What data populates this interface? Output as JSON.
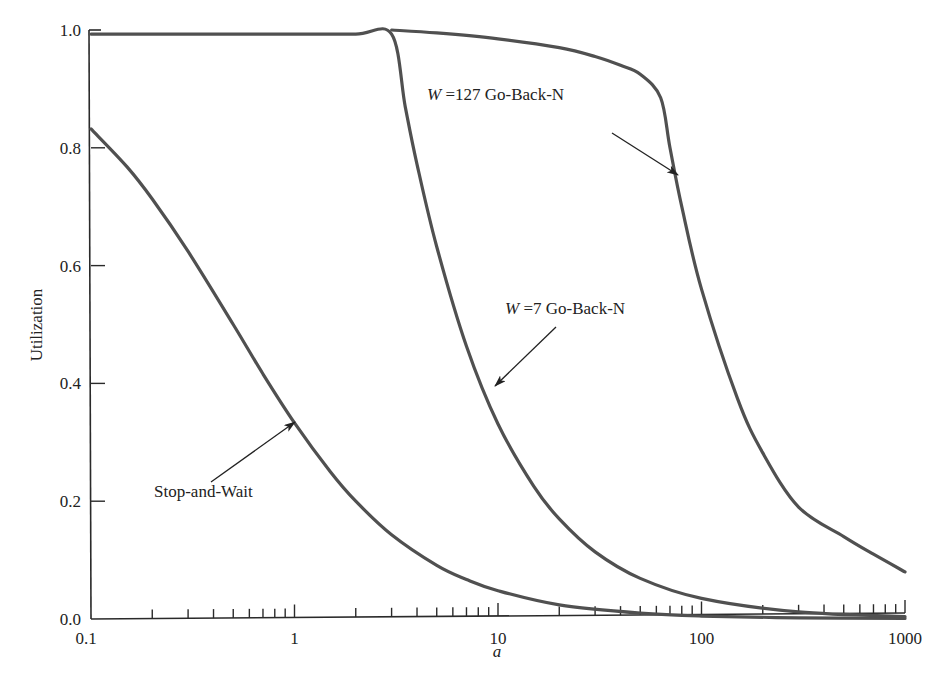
{
  "chart_data": {
    "type": "line",
    "title": "",
    "xlabel": "a",
    "ylabel": "Utilization",
    "xscale": "log",
    "xlim": [
      0.1,
      1000
    ],
    "ylim": [
      0.0,
      1.0
    ],
    "grid": false,
    "legend": "none (inline annotations with arrows)",
    "x_ticks": [
      {
        "value": 0.1,
        "label": "0.1"
      },
      {
        "value": 1,
        "label": "1"
      },
      {
        "value": 10,
        "label": "10"
      },
      {
        "value": 100,
        "label": "100"
      },
      {
        "value": 1000,
        "label": "1000"
      }
    ],
    "y_ticks": [
      {
        "value": 0.0,
        "label": "0.0"
      },
      {
        "value": 0.2,
        "label": "0.2"
      },
      {
        "value": 0.4,
        "label": "0.4"
      },
      {
        "value": 0.6,
        "label": "0.6"
      },
      {
        "value": 0.8,
        "label": "0.8"
      },
      {
        "value": 1.0,
        "label": "1.0"
      }
    ],
    "series": [
      {
        "name": "Stop-and-Wait",
        "x": [
          0.1,
          0.15,
          0.2,
          0.3,
          0.5,
          0.7,
          1,
          1.5,
          2,
          3,
          5,
          7,
          10,
          20,
          50,
          100,
          300,
          1000
        ],
        "values": [
          0.832,
          0.768,
          0.713,
          0.624,
          0.5,
          0.416,
          0.333,
          0.25,
          0.2,
          0.143,
          0.091,
          0.067,
          0.048,
          0.024,
          0.01,
          0.005,
          0.002,
          0.001
        ]
      },
      {
        "name": "W = 7 Go-Back-N",
        "x": [
          0.1,
          0.5,
          1,
          2,
          3,
          3.5,
          4,
          5,
          7,
          10,
          15,
          20,
          30,
          50,
          100,
          300,
          1000
        ],
        "values": [
          0.993,
          0.993,
          0.993,
          0.993,
          0.993,
          0.87,
          0.772,
          0.632,
          0.463,
          0.331,
          0.225,
          0.17,
          0.114,
          0.069,
          0.035,
          0.012,
          0.004
        ]
      },
      {
        "name": "W = 127 Go-Back-N",
        "x": [
          3,
          5,
          10,
          20,
          30,
          40,
          50,
          63,
          70,
          80,
          100,
          150,
          200,
          300,
          500,
          700,
          1000
        ],
        "values": [
          1.0,
          0.995,
          0.985,
          0.97,
          0.955,
          0.94,
          0.925,
          0.885,
          0.8,
          0.7,
          0.56,
          0.375,
          0.282,
          0.19,
          0.14,
          0.11,
          0.08
        ]
      }
    ],
    "annotations": [
      {
        "text_italic": "W",
        "text": " =127 Go-Back-N",
        "points_to_series": "W = 127 Go-Back-N",
        "label_pos": [
          427,
          100
        ],
        "arrow_from": [
          612,
          133
        ],
        "arrow_to": [
          678,
          175
        ]
      },
      {
        "text_italic": "W",
        "text": " =7 Go-Back-N",
        "points_to_series": "W = 7 Go-Back-N",
        "label_pos": [
          505,
          314
        ],
        "arrow_from": [
          556,
          327
        ],
        "arrow_to": [
          495,
          386
        ]
      },
      {
        "text": "Stop-and-Wait",
        "points_to_series": "Stop-and-Wait",
        "label_pos": [
          154,
          497
        ],
        "arrow_from": [
          211,
          482
        ],
        "arrow_to": [
          295,
          422
        ]
      }
    ]
  },
  "axes": {
    "x_title": "a",
    "y_title": "Utilization"
  }
}
